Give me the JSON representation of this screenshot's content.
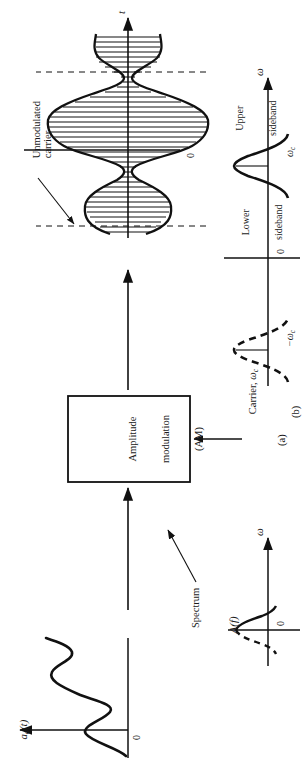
{
  "figure": {
    "panel_a": {
      "caption": "(a)",
      "input_signal_label": "a",
      "input_signal_sub": "a",
      "input_signal_arg": "(t)",
      "input_axis_zero": "0",
      "block_line1": "Amplitude",
      "block_line2": "modulation",
      "block_line3": "(AM)",
      "carrier_label": "Carrier, ",
      "carrier_symbol": "ω",
      "carrier_symbol_sub": "c",
      "output_axis_label": "t",
      "output_axis_zero": "0",
      "annotation_line1": "Unmodulated",
      "annotation_line2": "carrier"
    },
    "panel_b": {
      "caption": "(b)",
      "spectrum_link_label": "Spectrum",
      "baseband": {
        "amplitude_label": "A",
        "amplitude_arg": "(f)",
        "axis_label": "ω",
        "zero_label": "0"
      },
      "modulated": {
        "axis_label": "ω",
        "zero_label": "0",
        "pos_carrier_label": "ω",
        "pos_carrier_sub": "c",
        "neg_carrier_label": "−ω",
        "neg_carrier_sub": "c",
        "lower_sideband_line1": "Lower",
        "lower_sideband_line2": "sideband",
        "upper_sideband_line1": "Upper",
        "upper_sideband_line2": "sideband"
      }
    },
    "colors": {
      "ink": "#111111",
      "paper": "#ffffff"
    }
  }
}
